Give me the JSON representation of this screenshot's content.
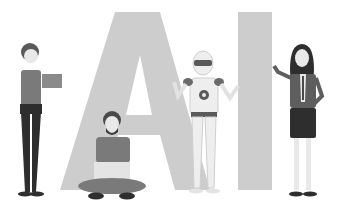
{
  "illustration": {
    "title": "AI",
    "letters": [
      "A",
      "I"
    ],
    "figures": [
      {
        "id": "woman-left",
        "description": "Woman with short hair holding a tablet"
      },
      {
        "id": "man-laptop",
        "description": "Bearded man sitting cross-legged with laptop"
      },
      {
        "id": "robot",
        "description": "Humanoid robot with visor"
      },
      {
        "id": "woman-right",
        "description": "Woman in business suit with long hair"
      }
    ],
    "colors": {
      "background": "#ffffff",
      "letter_fill": "#cfcfcf",
      "dark": "#2e2e2e",
      "mid": "#6f6f6f",
      "light": "#e6e6e6"
    }
  }
}
